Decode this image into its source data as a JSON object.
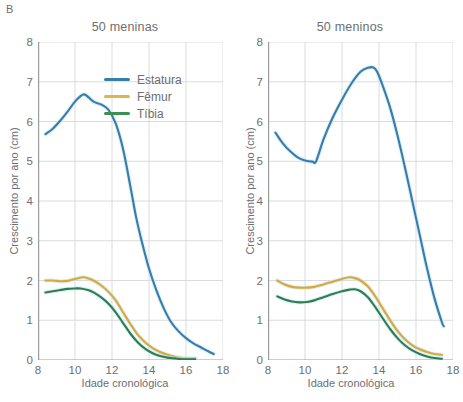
{
  "figure": {
    "panel_label": "B"
  },
  "legend": {
    "position": "inside-top-right-of-left-panel",
    "items": [
      {
        "label": "Estatura",
        "color": "#3a7ca8",
        "icon": "line-swatch-icon"
      },
      {
        "label": "Fêmur",
        "color": "#e0b352",
        "icon": "line-swatch-icon"
      },
      {
        "label": "Tíbia",
        "color": "#3f8f52",
        "icon": "line-swatch-icon"
      }
    ]
  },
  "axes": {
    "xlabel": "Idade cronológica",
    "ylabel": "Crescimento por ano (cm)",
    "xticks": [
      8,
      10,
      12,
      14,
      16,
      18
    ],
    "yticks": [
      0,
      1,
      2,
      3,
      4,
      5,
      6,
      7,
      8
    ],
    "xlim": [
      8,
      18
    ],
    "ylim": [
      0,
      8
    ],
    "grid": true
  },
  "chart_data": [
    {
      "type": "line",
      "title": "50 meninas",
      "xlabel": "Idade cronológica",
      "ylabel": "Crescimento por ano (cm)",
      "xlim": [
        8,
        18
      ],
      "ylim": [
        0,
        8
      ],
      "xticks": [
        8,
        10,
        12,
        14,
        16,
        18
      ],
      "yticks": [
        0,
        1,
        2,
        3,
        4,
        5,
        6,
        7,
        8
      ],
      "grid": true,
      "legend_position": "upper right",
      "series": [
        {
          "name": "Estatura",
          "color": "#3a7ca8",
          "x": [
            8.4,
            8.8,
            9.2,
            9.6,
            10.0,
            10.4,
            10.6,
            11.0,
            11.4,
            11.8,
            12.2,
            12.6,
            13.0,
            13.3,
            13.6,
            14.0,
            14.4,
            14.8,
            15.2,
            15.6,
            16.0,
            16.4,
            16.8,
            17.2,
            17.5
          ],
          "y": [
            5.68,
            5.82,
            6.02,
            6.25,
            6.5,
            6.67,
            6.66,
            6.5,
            6.43,
            6.3,
            5.95,
            5.3,
            4.35,
            3.6,
            3.0,
            2.3,
            1.75,
            1.3,
            0.95,
            0.72,
            0.55,
            0.42,
            0.32,
            0.22,
            0.15
          ]
        },
        {
          "name": "Fêmur",
          "color": "#d9a838",
          "x": [
            8.4,
            8.8,
            9.2,
            9.6,
            10.0,
            10.4,
            10.6,
            11.0,
            11.4,
            11.8,
            12.2,
            12.6,
            13.0,
            13.4,
            13.8,
            14.2,
            14.6,
            15.0,
            15.4,
            15.8,
            16.2,
            16.5
          ],
          "y": [
            2.0,
            2.0,
            1.98,
            1.99,
            2.04,
            2.08,
            2.07,
            2.0,
            1.88,
            1.72,
            1.5,
            1.2,
            0.9,
            0.63,
            0.44,
            0.3,
            0.2,
            0.13,
            0.08,
            0.05,
            0.04,
            0.04
          ]
        },
        {
          "name": "Tíbia",
          "color": "#2e7d4f",
          "x": [
            8.4,
            8.8,
            9.2,
            9.6,
            10.0,
            10.3,
            10.7,
            11.0,
            11.4,
            11.8,
            12.2,
            12.6,
            13.0,
            13.4,
            13.8,
            14.2,
            14.6,
            15.0,
            15.4,
            15.8,
            16.2,
            16.5
          ],
          "y": [
            1.7,
            1.73,
            1.76,
            1.79,
            1.8,
            1.8,
            1.76,
            1.7,
            1.58,
            1.42,
            1.2,
            0.93,
            0.66,
            0.44,
            0.28,
            0.17,
            0.1,
            0.06,
            0.04,
            0.02,
            0.02,
            0.02
          ]
        }
      ]
    },
    {
      "type": "line",
      "title": "50 meninos",
      "xlabel": "Idade cronológica",
      "ylabel": "Crescimento por ano (cm)",
      "xlim": [
        8,
        18
      ],
      "ylim": [
        0,
        8
      ],
      "xticks": [
        8,
        10,
        12,
        14,
        16,
        18
      ],
      "yticks": [
        0,
        1,
        2,
        3,
        4,
        5,
        6,
        7,
        8
      ],
      "grid": true,
      "legend_position": "none",
      "series": [
        {
          "name": "Estatura",
          "color": "#3a7ca8",
          "x": [
            8.4,
            8.8,
            9.2,
            9.6,
            10.0,
            10.4,
            10.6,
            11.0,
            11.5,
            12.0,
            12.5,
            13.0,
            13.4,
            13.7,
            13.9,
            14.2,
            14.6,
            15.0,
            15.4,
            15.8,
            16.2,
            16.6,
            17.0,
            17.4,
            17.5
          ],
          "y": [
            5.72,
            5.45,
            5.25,
            5.1,
            5.02,
            4.99,
            5.0,
            5.55,
            6.1,
            6.55,
            6.95,
            7.25,
            7.35,
            7.36,
            7.25,
            6.9,
            6.35,
            5.65,
            4.85,
            4.0,
            3.15,
            2.3,
            1.55,
            0.95,
            0.85
          ]
        },
        {
          "name": "Fêmur",
          "color": "#d9a838",
          "x": [
            8.5,
            8.9,
            9.3,
            9.7,
            10.1,
            10.5,
            11.0,
            11.5,
            12.0,
            12.4,
            12.7,
            13.0,
            13.4,
            13.8,
            14.2,
            14.6,
            15.0,
            15.4,
            15.8,
            16.2,
            16.6,
            17.0,
            17.4
          ],
          "y": [
            2.0,
            1.9,
            1.84,
            1.82,
            1.82,
            1.84,
            1.9,
            1.97,
            2.04,
            2.08,
            2.06,
            2.0,
            1.85,
            1.6,
            1.3,
            1.0,
            0.73,
            0.52,
            0.37,
            0.27,
            0.2,
            0.15,
            0.13
          ]
        },
        {
          "name": "Tíbia",
          "color": "#2e7d4f",
          "x": [
            8.5,
            8.9,
            9.3,
            9.7,
            10.1,
            10.5,
            11.0,
            11.5,
            12.0,
            12.4,
            12.7,
            13.0,
            13.4,
            13.8,
            14.2,
            14.6,
            15.0,
            15.4,
            15.8,
            16.2,
            16.6,
            17.0,
            17.4
          ],
          "y": [
            1.6,
            1.52,
            1.47,
            1.45,
            1.46,
            1.5,
            1.58,
            1.66,
            1.73,
            1.77,
            1.78,
            1.73,
            1.58,
            1.33,
            1.05,
            0.78,
            0.55,
            0.37,
            0.24,
            0.15,
            0.09,
            0.05,
            0.03
          ]
        }
      ]
    }
  ]
}
